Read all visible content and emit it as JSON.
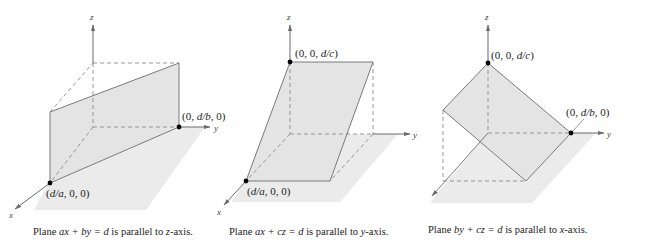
{
  "colors": {
    "plane_fill": "#e6e6e6",
    "floor_fill": "#ebebeb",
    "line": "#7a7a7a",
    "axis": "#6b6b6b",
    "point": "#000000",
    "text": "#222222"
  },
  "axes": {
    "x": "x",
    "y": "y",
    "z": "z"
  },
  "diagrams": [
    {
      "points": [
        {
          "text": "(d/a, 0, 0)",
          "parts": [
            "(",
            "d/a",
            ", 0, 0)"
          ]
        },
        {
          "text": "(0, d/b, 0)",
          "parts": [
            "(0, ",
            "d/b",
            ", 0)"
          ]
        }
      ],
      "caption": {
        "prefix": "Plane ",
        "equation": "ax + by = d",
        "middle": " is parallel to ",
        "axis": "z",
        "suffix": "-axis."
      }
    },
    {
      "points": [
        {
          "text": "(0, 0, d/c)",
          "parts": [
            "(0, 0, ",
            "d/c",
            ")"
          ]
        },
        {
          "text": "(d/a, 0, 0)",
          "parts": [
            "(",
            "d/a",
            ", 0, 0)"
          ]
        }
      ],
      "caption": {
        "prefix": "Plane ",
        "equation": "ax + cz = d",
        "middle": " is parallel to ",
        "axis": "y",
        "suffix": "-axis."
      }
    },
    {
      "points": [
        {
          "text": "(0, 0, d/c)",
          "parts": [
            "(0, 0, ",
            "d/c",
            ")"
          ]
        },
        {
          "text": "(0, d/b, 0)",
          "parts": [
            "(0, ",
            "d/b",
            ", 0)"
          ]
        }
      ],
      "caption": {
        "prefix": "Plane ",
        "equation": "by + cz = d",
        "middle": " is parallel to ",
        "axis": "x",
        "suffix": "-axis."
      }
    }
  ]
}
